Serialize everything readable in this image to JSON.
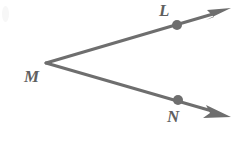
{
  "figure": {
    "type": "geometry-diagram",
    "background_color": "#ffffff",
    "stroke_color": "#6e6e6e",
    "label_color": "#5f5f5f",
    "point_color": "#6e6e6e",
    "canvas": {
      "width": 240,
      "height": 150
    },
    "labels": {
      "vertex": "M",
      "upper_point": "L",
      "lower_point": "N"
    },
    "points": [
      {
        "name": "M",
        "label": "M",
        "x": 46,
        "y": 63,
        "dot": false,
        "role": "vertex"
      },
      {
        "name": "L",
        "label": "L",
        "x": 177,
        "y": 25,
        "dot": true,
        "role": "ray-point"
      },
      {
        "name": "N",
        "label": "N",
        "x": 178,
        "y": 100,
        "dot": true,
        "role": "ray-point"
      }
    ],
    "rays": [
      {
        "name": "ray-ML",
        "from": "M",
        "through": "L",
        "start": {
          "x": 46,
          "y": 63
        },
        "end": {
          "x": 231,
          "y": 9
        },
        "arrowhead": "end",
        "stroke_width": 3
      },
      {
        "name": "ray-MN",
        "from": "M",
        "through": "N",
        "start": {
          "x": 46,
          "y": 63
        },
        "end": {
          "x": 231,
          "y": 116
        },
        "arrowhead": "end",
        "stroke_width": 3
      }
    ],
    "dot_radius": 5
  }
}
